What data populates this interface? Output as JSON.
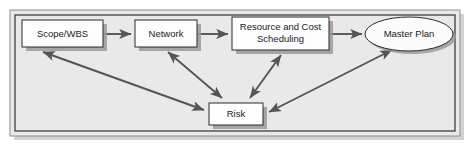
{
  "diagram": {
    "background_color": "#e9e9e9",
    "page_color": "#ffffff",
    "border_color": "#4a4a4a",
    "node_fill": "#fdfdfd",
    "node_stroke": "#2b2b2b",
    "arrow_color": "#555555",
    "shadow_color": "#9a9a9a",
    "nodes": [
      {
        "id": "scope-wbs",
        "label": "Scope/WBS",
        "shape": "rectangle",
        "x": 22,
        "y": 20,
        "width": 81,
        "height": 27
      },
      {
        "id": "network",
        "label": "Network",
        "shape": "rectangle",
        "x": 135,
        "y": 20,
        "width": 62,
        "height": 27
      },
      {
        "id": "resource-cost-scheduling",
        "label_line1": "Resource and Cost",
        "label_line2": "Scheduling",
        "shape": "rectangle",
        "x": 232,
        "y": 17,
        "width": 97,
        "height": 33
      },
      {
        "id": "master-plan",
        "label": "Master Plan",
        "shape": "ellipse",
        "cx": 409,
        "cy": 34,
        "rx": 44,
        "ry": 17
      },
      {
        "id": "risk",
        "label": "Risk",
        "shape": "rectangle",
        "x": 209,
        "y": 103,
        "width": 54,
        "height": 22
      }
    ],
    "edges": [
      {
        "id": "scope-to-network",
        "from": "scope-wbs",
        "to": "network",
        "direction": "forward"
      },
      {
        "id": "network-to-resource",
        "from": "network",
        "to": "resource-cost-scheduling",
        "direction": "forward"
      },
      {
        "id": "resource-to-master-plan",
        "from": "resource-cost-scheduling",
        "to": "master-plan",
        "direction": "forward"
      },
      {
        "id": "scope-risk",
        "from": "scope-wbs",
        "to": "risk",
        "direction": "bidirectional"
      },
      {
        "id": "network-risk",
        "from": "network",
        "to": "risk",
        "direction": "bidirectional"
      },
      {
        "id": "resource-risk",
        "from": "resource-cost-scheduling",
        "to": "risk",
        "direction": "bidirectional"
      },
      {
        "id": "master-plan-risk",
        "from": "master-plan",
        "to": "risk",
        "direction": "bidirectional"
      }
    ]
  }
}
